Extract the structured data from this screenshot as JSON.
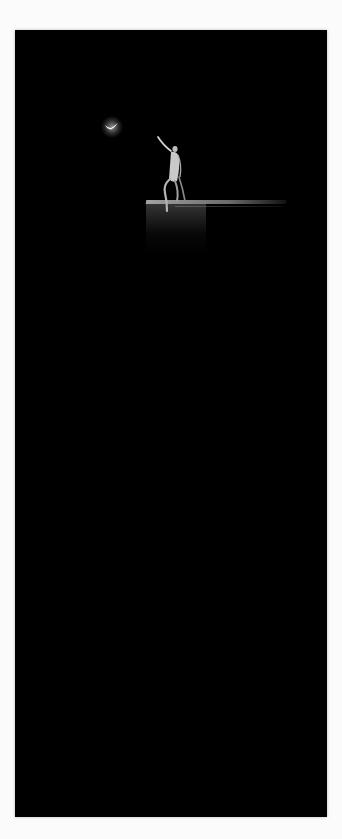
{
  "page": {
    "background_color": "#fbfbfb"
  },
  "artwork": {
    "background_color": "#000000",
    "elements": [
      {
        "name": "glowing-bird",
        "description": "small glowing white bird in flight, upper left"
      },
      {
        "name": "dancer-figure",
        "description": "pale figure seated on platform edge, arm raised toward bird"
      },
      {
        "name": "platform",
        "description": "dimly lit rectangular ledge the figure sits on"
      }
    ]
  }
}
